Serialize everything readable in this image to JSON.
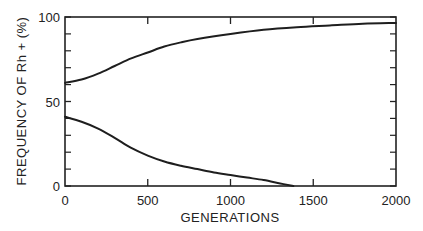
{
  "chart_data": {
    "type": "line",
    "title": "",
    "xlabel": "GENERATIONS",
    "ylabel": "FREQUENCY OF Rh + (%)",
    "xlim": [
      0,
      2000
    ],
    "ylim": [
      0,
      100
    ],
    "x_ticks": [
      0,
      500,
      1000,
      1500,
      2000
    ],
    "x_tick_labels": [
      "0",
      "500",
      "1000",
      "1500",
      "2000"
    ],
    "y_ticks": [
      0,
      50,
      100
    ],
    "y_tick_labels": [
      "0",
      "50",
      "100"
    ],
    "y_minor_ticks": [
      10,
      20,
      30,
      40,
      60,
      70,
      80,
      90
    ],
    "grid": false,
    "legend": null,
    "series": [
      {
        "name": "upper curve",
        "x": [
          0,
          100,
          200,
          300,
          400,
          500,
          600,
          700,
          800,
          1000,
          1200,
          1400,
          1600,
          1800,
          2000
        ],
        "values": [
          61,
          63,
          66.5,
          71,
          75.5,
          79,
          82.5,
          85,
          87,
          90,
          92.5,
          94,
          95,
          96,
          96.5
        ]
      },
      {
        "name": "lower curve",
        "x": [
          0,
          100,
          200,
          300,
          400,
          500,
          600,
          700,
          800,
          900,
          1000,
          1100,
          1200,
          1300,
          1380
        ],
        "values": [
          41,
          38,
          34,
          28.5,
          22.5,
          18,
          14.5,
          12,
          10,
          8,
          6.5,
          5,
          3.5,
          1.5,
          0
        ]
      }
    ]
  }
}
